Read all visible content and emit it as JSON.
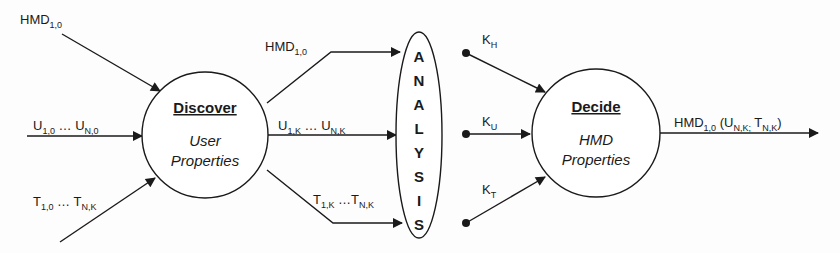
{
  "diagram": {
    "type": "flow",
    "nodes": {
      "discover": {
        "title": "Discover",
        "line1": "User",
        "line2": "Properties"
      },
      "analysis": {
        "letters": [
          "A",
          "N",
          "A",
          "L",
          "Y",
          "S",
          "I",
          "S"
        ],
        "label": "ANALYSIS"
      },
      "decide": {
        "title": "Decide",
        "line1": "HMD",
        "line2": "Properties"
      }
    },
    "inputs": {
      "hmd": {
        "main": "HMD",
        "sub": "1,0"
      },
      "users": {
        "u1": "U",
        "u1_sub": "1,0",
        "dots": " … ",
        "un": "U",
        "un_sub": "N,0"
      },
      "tasks": {
        "t1": "T",
        "t1_sub": "1,0",
        "dots": " … ",
        "tn": "T",
        "tn_sub": "N,K"
      }
    },
    "discover_outputs": {
      "hmd": {
        "main": "HMD",
        "sub": "1,0"
      },
      "users": {
        "u1": "U",
        "u1_sub": "1,K",
        "dots": " … ",
        "un": "U",
        "un_sub": "N,K"
      },
      "tasks": {
        "t1": "T",
        "t1_sub": "1,K",
        "dots": " …",
        "tn": "T",
        "tn_sub": "N,K"
      }
    },
    "constants": {
      "kh": {
        "main": "K",
        "sub": "H"
      },
      "ku": {
        "main": "K",
        "sub": "U"
      },
      "kt": {
        "main": "K",
        "sub": "T"
      }
    },
    "output": {
      "main": "HMD",
      "sub": "1,0",
      "open": " (U",
      "u_sub": "N,K;",
      "t": " T",
      "t_sub": "N,K",
      "close": ")"
    }
  }
}
